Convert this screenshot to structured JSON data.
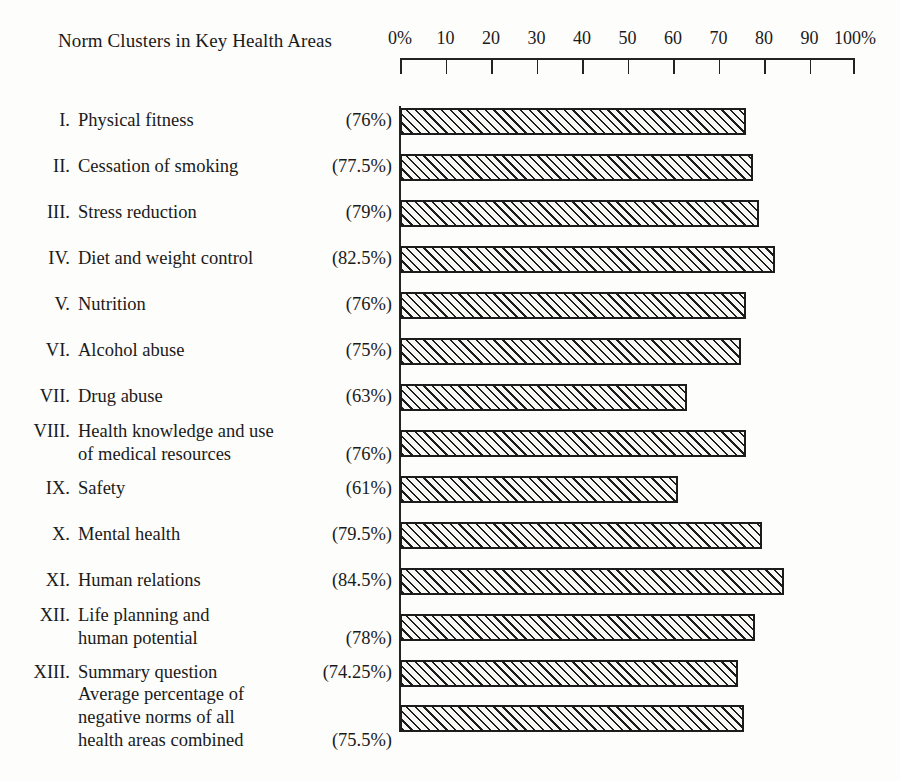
{
  "chart_data": {
    "type": "bar",
    "orientation": "horizontal",
    "title": "Norm Clusters in Key Health Areas",
    "xlabel": "",
    "ylabel": "",
    "xlim": [
      0,
      100
    ],
    "grid": false,
    "legend": "none",
    "axis_ticks": [
      "0%",
      "10",
      "20",
      "30",
      "40",
      "50",
      "60",
      "70",
      "80",
      "90",
      "100%"
    ],
    "axis_tick_values": [
      0,
      10,
      20,
      30,
      40,
      50,
      60,
      70,
      80,
      90,
      100
    ],
    "categories": [
      "I. Physical fitness",
      "II. Cessation of smoking",
      "III. Stress reduction",
      "IV. Diet and weight control",
      "V. Nutrition",
      "VI. Alcohol abuse",
      "VII. Drug abuse",
      "VIII. Health knowledge and use of medical resources",
      "IX. Safety",
      "X. Mental health",
      "XI. Human relations",
      "XII. Life planning and human potential",
      "XIII. Summary question",
      "Average percentage of negative norms of all health areas combined"
    ],
    "values": [
      76,
      77.5,
      79,
      82.5,
      76,
      75,
      63,
      76,
      61,
      79.5,
      84.5,
      78,
      74.25,
      75.5
    ],
    "value_labels": [
      "(76%)",
      "(77.5%)",
      "(79%)",
      "(82.5%)",
      "(76%)",
      "(75%)",
      "(63%)",
      "(76%)",
      "(61%)",
      "(79.5%)",
      "(84.5%)",
      "(78%)",
      "(74.25%)",
      "(75.5%)"
    ]
  },
  "rows": [
    {
      "numeral": "I.",
      "lines": [
        "Physical fitness"
      ],
      "pct": "(76%)",
      "value": 76,
      "pct_line": 0
    },
    {
      "numeral": "II.",
      "lines": [
        "Cessation of smoking"
      ],
      "pct": "(77.5%)",
      "value": 77.5,
      "pct_line": 0
    },
    {
      "numeral": "III.",
      "lines": [
        "Stress reduction"
      ],
      "pct": "(79%)",
      "value": 79,
      "pct_line": 0
    },
    {
      "numeral": "IV.",
      "lines": [
        "Diet and weight control"
      ],
      "pct": "(82.5%)",
      "value": 82.5,
      "pct_line": 0
    },
    {
      "numeral": "V.",
      "lines": [
        "Nutrition"
      ],
      "pct": "(76%)",
      "value": 76,
      "pct_line": 0
    },
    {
      "numeral": "VI.",
      "lines": [
        "Alcohol abuse"
      ],
      "pct": "(75%)",
      "value": 75,
      "pct_line": 0
    },
    {
      "numeral": "VII.",
      "lines": [
        "Drug abuse"
      ],
      "pct": "(63%)",
      "value": 63,
      "pct_line": 0
    },
    {
      "numeral": "VIII.",
      "lines": [
        "Health knowledge and use",
        "of medical resources"
      ],
      "pct": "(76%)",
      "value": 76,
      "pct_line": 1
    },
    {
      "numeral": "IX.",
      "lines": [
        "Safety"
      ],
      "pct": "(61%)",
      "value": 61,
      "pct_line": 0
    },
    {
      "numeral": "X.",
      "lines": [
        "Mental health"
      ],
      "pct": "(79.5%)",
      "value": 79.5,
      "pct_line": 0
    },
    {
      "numeral": "XI.",
      "lines": [
        "Human relations"
      ],
      "pct": "(84.5%)",
      "value": 84.5,
      "pct_line": 0
    },
    {
      "numeral": "XII.",
      "lines": [
        "Life planning and",
        "human potential"
      ],
      "pct": "(78%)",
      "value": 78,
      "pct_line": 1
    },
    {
      "numeral": "XIII.",
      "lines": [
        "Summary question"
      ],
      "pct": "(74.25%)",
      "value": 74.25,
      "pct_line": 0
    },
    {
      "numeral": "",
      "lines": [
        "Average percentage of",
        "negative norms of all",
        "health areas combined"
      ],
      "pct": "(75.5%)",
      "value": 75.5,
      "pct_line": 2
    }
  ],
  "colors": {
    "ink": "#1c1c1c",
    "paper": "#fdfdfb",
    "bar_fill": "#f7f7f4"
  }
}
